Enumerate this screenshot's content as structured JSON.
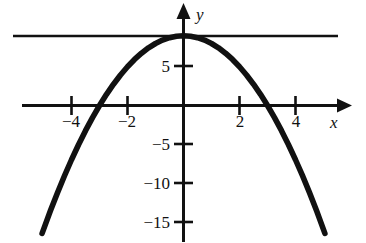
{
  "figure": {
    "background_color": "#ffffff",
    "ink_color": "#111111"
  },
  "axes": {
    "x_axis_name": "x",
    "y_axis_name": "y",
    "x_ticks": [
      {
        "label": "−4",
        "value": -4
      },
      {
        "label": "−2",
        "value": -2
      },
      {
        "label": "2",
        "value": 2
      },
      {
        "label": "4",
        "value": 4
      }
    ],
    "y_ticks": [
      {
        "label": "5",
        "value": 5
      },
      {
        "label": "−5",
        "value": -5
      },
      {
        "label": "−10",
        "value": -10
      },
      {
        "label": "−15",
        "value": -15
      }
    ]
  },
  "chart_data": {
    "type": "line",
    "title": "",
    "xlabel": "x",
    "ylabel": "y",
    "xlim": [
      -6.1,
      5.9
    ],
    "ylim": [
      -15.5,
      9.5
    ],
    "grid": false,
    "legend": "none",
    "series": [
      {
        "name": "parabola",
        "equation": "y = 9 - x^2",
        "style": "solid-thick",
        "x": [
          -5.05,
          -4.75,
          -4.5,
          -4.25,
          -4,
          -3.75,
          -3.5,
          -3.25,
          -3,
          -2.75,
          -2.5,
          -2.25,
          -2,
          -1.75,
          -1.5,
          -1.25,
          -1,
          -0.75,
          -0.5,
          -0.25,
          0,
          0.25,
          0.5,
          0.75,
          1,
          1.25,
          1.5,
          1.75,
          2,
          2.25,
          2.5,
          2.75,
          3,
          3.25,
          3.5,
          3.75,
          4,
          4.25,
          4.5,
          4.75,
          5.05
        ],
        "y": [
          -16.5,
          -13.56,
          -11.25,
          -9.06,
          -7,
          -5.06,
          -3.25,
          -1.56,
          0,
          1.44,
          2.75,
          3.94,
          5,
          5.94,
          6.75,
          7.44,
          8,
          8.44,
          8.75,
          8.94,
          9,
          8.94,
          8.75,
          8.44,
          8,
          7.44,
          6.75,
          5.94,
          5,
          3.94,
          2.75,
          1.44,
          0,
          -1.56,
          -3.25,
          -5.06,
          -7,
          -9.06,
          -11.25,
          -13.56,
          -16.5
        ],
        "roots": [
          -3,
          3
        ],
        "vertex": [
          0,
          9
        ]
      },
      {
        "name": "horizontal-tangent-line",
        "equation": "y = 9",
        "style": "solid-thin",
        "x": [
          -6.05,
          5.55
        ],
        "y": [
          9,
          9
        ]
      }
    ]
  }
}
